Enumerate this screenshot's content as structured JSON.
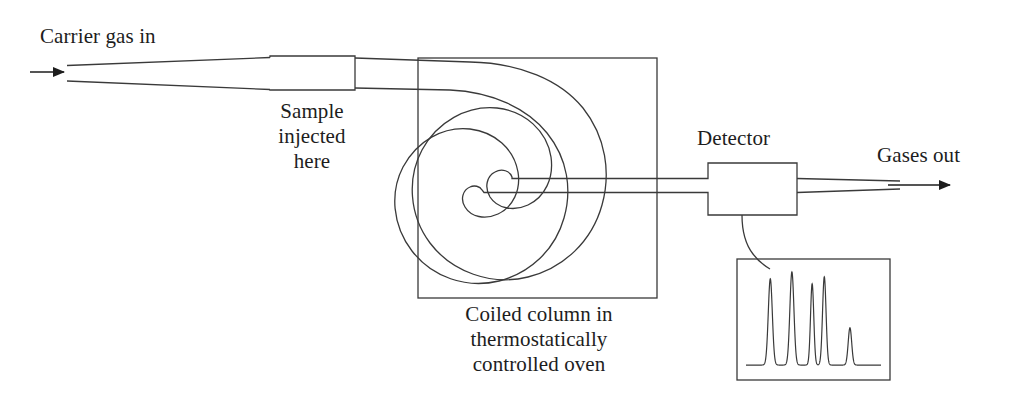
{
  "diagram": {
    "stroke_color": "#3a3a3a",
    "arrow_color": "#1d1d1d",
    "background_color": "#ffffff"
  },
  "labels": {
    "carrier_gas_in": "Carrier gas in",
    "sample_injected_here": "Sample\ninjected\nhere",
    "sample_injected_line1": "Sample",
    "sample_injected_line2": "injected",
    "sample_injected_line3": "here",
    "coiled_column_line1": "Coiled column in",
    "coiled_column_line2": "thermostatically",
    "coiled_column_line3": "controlled oven",
    "detector": "Detector",
    "gases_out": "Gases out"
  },
  "components": {
    "inlet_arrow": "carrier-gas-inlet-arrow",
    "injector_box": "sample-injection-port",
    "oven_box": "thermostatically-controlled-oven",
    "coiled_column": "coiled-capillary-column",
    "detector_box": "detector-unit",
    "signal_wire": "detector-signal-wire",
    "chromatogram_box": "chromatogram-readout",
    "outlet_arrow": "gases-out-arrow"
  },
  "chart_data": {
    "type": "line",
    "xlabel": "Retention time",
    "ylabel": "Detector signal",
    "grid": false,
    "legend": "none",
    "xlim": [
      0,
      100
    ],
    "ylim": [
      0,
      1
    ],
    "peaks": [
      {
        "index": 1,
        "x": 18,
        "height": 0.88,
        "width": 3.0
      },
      {
        "index": 2,
        "x": 34,
        "height": 0.95,
        "width": 3.0
      },
      {
        "index": 3,
        "x": 49,
        "height": 0.83,
        "width": 2.4
      },
      {
        "index": 4,
        "x": 58,
        "height": 0.9,
        "width": 2.6
      },
      {
        "index": 5,
        "x": 77,
        "height": 0.38,
        "width": 2.6
      }
    ],
    "baseline": 0.02,
    "x": [
      18,
      34,
      49,
      58,
      77
    ],
    "values": [
      0.88,
      0.95,
      0.83,
      0.9,
      0.38
    ],
    "categories": [
      "peak 1",
      "peak 2",
      "peak 3",
      "peak 4",
      "peak 5"
    ]
  }
}
